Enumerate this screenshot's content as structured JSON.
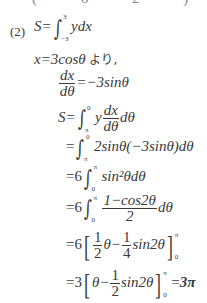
{
  "top_fragment": "( 6 2 ) 3",
  "problem_label": "(2)",
  "lines": {
    "l1": {
      "lhs": "S=",
      "upper": "3",
      "lower": "−3",
      "body": "ydx"
    },
    "l2": {
      "text": "x=3cosθ",
      "suffix": "より,"
    },
    "l3": {
      "num": "dx",
      "den": "dθ",
      "rhs": "=−3sinθ"
    },
    "l4": {
      "lhs": "S=",
      "upper": "0",
      "lower": "π",
      "pre": "y",
      "num": "dx",
      "den": "dθ",
      "post": "dθ"
    },
    "l5": {
      "lhs": "=",
      "upper": "0",
      "lower": "π",
      "body": "2sinθ(−3sinθ)dθ"
    },
    "l6": {
      "lhs": "=6",
      "upper": "π",
      "lower": "0",
      "body": "sin²θdθ"
    },
    "l7": {
      "lhs": "=6",
      "upper": "π",
      "lower": "0",
      "num": "1−cos2θ",
      "den": "2",
      "post": "dθ"
    },
    "l8": {
      "lhs": "=6",
      "f1n": "1",
      "f1d": "2",
      "mid": "θ−",
      "f2n": "1",
      "f2d": "4",
      "post": "sin2θ",
      "upper": "π",
      "lower": "0"
    },
    "l9": {
      "lhs": "=3",
      "pre": "θ−",
      "fn": "1",
      "fd": "2",
      "post": "sin2θ",
      "upper": "π",
      "lower": "0",
      "eq": "=",
      "result": "3π"
    }
  }
}
